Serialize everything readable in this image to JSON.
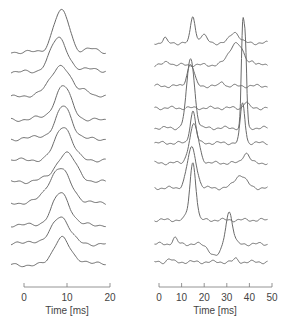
{
  "chart_data": [
    {
      "type": "line",
      "panel": "left",
      "title": "",
      "xlabel": "Time [ms]",
      "ylabel": "",
      "xlim": [
        0,
        20
      ],
      "xticks": [
        0,
        10,
        20
      ],
      "xtick_labels": [
        "0",
        "10",
        "20"
      ],
      "grid": false,
      "legend": null,
      "layout": "stacked waterfall traces, vertically offset",
      "n_traces": 11,
      "series": [
        {
          "name": "trace-1",
          "baseline_px": 52,
          "peak_ms": 8.2,
          "peak_height_px": 36,
          "width_ms": 1.6,
          "bumps": [
            {
              "ms": 10.2,
              "h": 14,
              "w": 1.2
            },
            {
              "ms": 15.5,
              "h": 3,
              "w": 1.4
            }
          ]
        },
        {
          "name": "trace-2",
          "baseline_px": 72,
          "peak_ms": 8.1,
          "peak_height_px": 34,
          "width_ms": 2.0,
          "bumps": [
            {
              "ms": 16.0,
              "h": 4,
              "w": 1.5
            }
          ]
        },
        {
          "name": "trace-3",
          "baseline_px": 97,
          "peak_ms": 8.6,
          "peak_height_px": 32,
          "width_ms": 2.2,
          "bumps": [
            {
              "ms": 14.5,
              "h": 7,
              "w": 1.2
            },
            {
              "ms": 3.5,
              "h": 3,
              "w": 2.0
            }
          ]
        },
        {
          "name": "trace-4",
          "baseline_px": 120,
          "peak_ms": 9.1,
          "peak_height_px": 34,
          "width_ms": 1.9,
          "bumps": [
            {
              "ms": 3.0,
              "h": 2,
              "w": 2.0
            }
          ]
        },
        {
          "name": "trace-5",
          "baseline_px": 139,
          "peak_ms": 9.3,
          "peak_height_px": 33,
          "width_ms": 1.8,
          "bumps": [
            {
              "ms": 4.0,
              "h": 3,
              "w": 1.8
            }
          ]
        },
        {
          "name": "trace-6",
          "baseline_px": 160,
          "peak_ms": 9.2,
          "peak_height_px": 34,
          "width_ms": 1.9,
          "bumps": []
        },
        {
          "name": "trace-7",
          "baseline_px": 182,
          "peak_ms": 9.8,
          "peak_height_px": 29,
          "width_ms": 2.3,
          "bumps": [
            {
              "ms": 3.5,
              "h": 2,
              "w": 1.6
            }
          ]
        },
        {
          "name": "trace-8",
          "baseline_px": 203,
          "peak_ms": 8.6,
          "peak_height_px": 30,
          "width_ms": 2.4,
          "bumps": [
            {
              "ms": 6.5,
              "h": 6,
              "w": 2.5
            }
          ]
        },
        {
          "name": "trace-9",
          "baseline_px": 225,
          "peak_ms": 8.6,
          "peak_height_px": 32,
          "width_ms": 2.0,
          "bumps": []
        },
        {
          "name": "trace-10",
          "baseline_px": 244,
          "peak_ms": 8.5,
          "peak_height_px": 28,
          "width_ms": 2.0,
          "bumps": [
            {
              "ms": 2.0,
              "h": 3,
              "w": 1.4
            }
          ]
        },
        {
          "name": "trace-11",
          "baseline_px": 265,
          "peak_ms": 8.7,
          "peak_height_px": 28,
          "width_ms": 1.8,
          "bumps": [
            {
              "ms": 14.0,
              "h": 4,
              "w": 2.0
            }
          ]
        }
      ]
    },
    {
      "type": "line",
      "panel": "right",
      "title": "",
      "xlabel": "Time [ms]",
      "ylabel": "",
      "xlim": [
        0,
        50
      ],
      "xticks": [
        0,
        10,
        20,
        30,
        40,
        50
      ],
      "xtick_labels": [
        "0",
        "10",
        "20",
        "30",
        "40",
        "50"
      ],
      "grid": false,
      "legend": null,
      "layout": "stacked waterfall traces, vertically offset",
      "n_traces": 11,
      "series": [
        {
          "name": "trace-1",
          "baseline_px": 43,
          "peaks": [
            {
              "ms": 15.0,
              "h": 27,
              "w": 1.0
            },
            {
              "ms": 19.5,
              "h": 8,
              "w": 1.5
            },
            {
              "ms": 33.5,
              "h": 11,
              "w": 2.0
            },
            {
              "ms": 2.5,
              "h": 5,
              "w": 0.8
            }
          ]
        },
        {
          "name": "trace-2",
          "baseline_px": 65,
          "peaks": [
            {
              "ms": 34.0,
              "h": 22,
              "w": 3.0
            },
            {
              "ms": 41.5,
              "h": 4,
              "w": 0.8
            },
            {
              "ms": 4.0,
              "h": 3,
              "w": 1.5
            }
          ]
        },
        {
          "name": "trace-3",
          "baseline_px": 86,
          "peaks": [
            {
              "ms": 14.0,
              "h": 22,
              "w": 1.5
            },
            {
              "ms": 28.0,
              "h": 5,
              "w": 0.8
            }
          ]
        },
        {
          "name": "trace-4",
          "baseline_px": 108,
          "peaks": [
            {
              "ms": 38.5,
              "h": 6,
              "w": 1.0
            }
          ]
        },
        {
          "name": "trace-5",
          "baseline_px": 128,
          "peaks": [
            {
              "ms": 14.0,
              "h": 70,
              "w": 1.7
            },
            {
              "ms": 37.0,
              "h": 95,
              "w": 0.6
            },
            {
              "ms": 38.2,
              "h": 80,
              "w": 0.6
            }
          ]
        },
        {
          "name": "trace-6",
          "baseline_px": 143,
          "peaks": [
            {
              "ms": 15.0,
              "h": 32,
              "w": 1.2
            },
            {
              "ms": 37.0,
              "h": 40,
              "w": 1.0
            }
          ]
        },
        {
          "name": "trace-7",
          "baseline_px": 163,
          "peaks": [
            {
              "ms": 15.5,
              "h": 38,
              "w": 2.0
            },
            {
              "ms": 38.5,
              "h": 10,
              "w": 1.5
            }
          ]
        },
        {
          "name": "trace-8",
          "baseline_px": 188,
          "peaks": [
            {
              "ms": 14.5,
              "h": 40,
              "w": 2.0
            },
            {
              "ms": 36.0,
              "h": 13,
              "w": 2.5
            }
          ]
        },
        {
          "name": "trace-9",
          "baseline_px": 220,
          "peaks": [
            {
              "ms": 15.0,
              "h": 58,
              "w": 1.3
            },
            {
              "ms": 12.0,
              "h": 3,
              "w": 0.8
            }
          ]
        },
        {
          "name": "trace-10",
          "baseline_px": 244,
          "peaks": [
            {
              "ms": 31.0,
              "h": 33,
              "w": 1.5
            },
            {
              "ms": 7.0,
              "h": 6,
              "w": 1.0
            },
            {
              "ms": 25.0,
              "h": -12,
              "w": 2.5
            }
          ]
        },
        {
          "name": "trace-11",
          "baseline_px": 262,
          "peaks": [
            {
              "ms": 4.5,
              "h": 3,
              "w": 1.0
            },
            {
              "ms": 34.0,
              "h": 3,
              "w": 1.0
            }
          ]
        }
      ]
    }
  ],
  "axes": {
    "left": {
      "label": "Time [ms]",
      "ticks": [
        "0",
        "10",
        "20"
      ]
    },
    "right": {
      "label": "Time [ms]",
      "ticks": [
        "0",
        "10",
        "20",
        "30",
        "40",
        "50"
      ]
    }
  },
  "colors": {
    "trace": "#6a6a6a",
    "axis": "#7a7a7a",
    "text": "#444444",
    "background": "#ffffff"
  }
}
